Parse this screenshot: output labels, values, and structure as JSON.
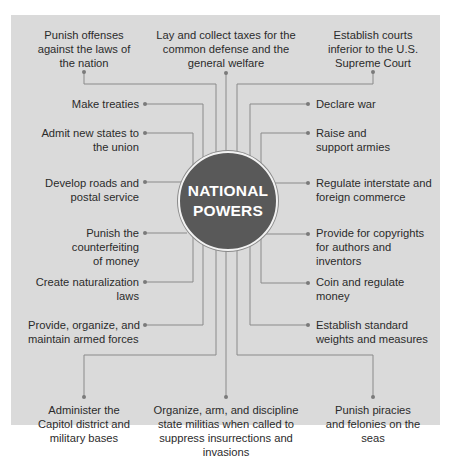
{
  "hub": {
    "line1": "NATIONAL",
    "line2": "POWERS"
  },
  "colors": {
    "panel": "#dadada",
    "hub": "#595959",
    "line": "#8a8a8a",
    "text": "#2b2b2b"
  },
  "top": [
    {
      "id": "punish-offenses",
      "text": "Punish offenses against the laws of the nation"
    },
    {
      "id": "taxes",
      "text": "Lay and collect taxes for the common defense and the general welfare"
    },
    {
      "id": "courts",
      "text": "Establish courts inferior to the U.S. Supreme Court"
    }
  ],
  "left": [
    {
      "id": "treaties",
      "text": "Make treaties"
    },
    {
      "id": "new-states",
      "text": "Admit new states to the union"
    },
    {
      "id": "roads",
      "text": "Develop roads and postal service"
    },
    {
      "id": "counterfeiting",
      "text": "Punish the counterfeiting of money"
    },
    {
      "id": "naturalization",
      "text": "Create naturalization laws"
    },
    {
      "id": "armed-forces",
      "text": "Provide, organize, and maintain armed forces"
    }
  ],
  "right": [
    {
      "id": "declare-war",
      "text": "Declare war"
    },
    {
      "id": "armies",
      "text": "Raise and support armies"
    },
    {
      "id": "commerce",
      "text": "Regulate interstate and foreign commerce"
    },
    {
      "id": "copyrights",
      "text": "Provide for copyrights for authors and inventors"
    },
    {
      "id": "coin",
      "text": "Coin and regulate money"
    },
    {
      "id": "weights",
      "text": "Establish standard weights and measures"
    }
  ],
  "bottom": [
    {
      "id": "capitol",
      "text": "Administer the Capitol district and military bases"
    },
    {
      "id": "militias",
      "text": "Organize, arm, and discipline state militias when called to suppress insurrections and invasions"
    },
    {
      "id": "piracies",
      "text": "Punish piracies and felonies on the seas"
    }
  ]
}
